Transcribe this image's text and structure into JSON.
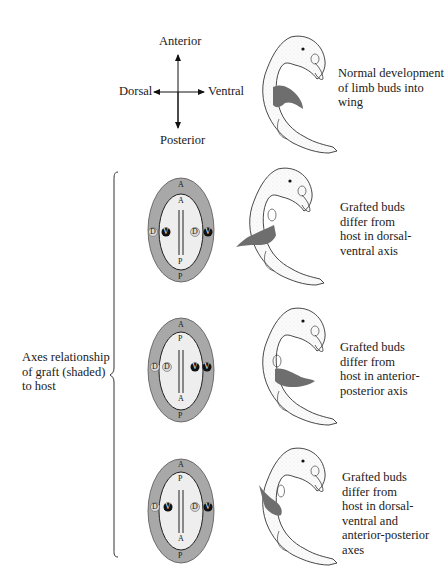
{
  "axes_key": {
    "anterior": "Anterior",
    "posterior": "Posterior",
    "dorsal": "Dorsal",
    "ventral": "Ventral"
  },
  "normal": {
    "caption": "Normal development\nof limb buds into\nwing"
  },
  "group_label": "Axes relationship\nof graft (shaded)\nto host",
  "panels": [
    {
      "caption": "Grafted buds\ndiffer from\nhost in dorsal-\nventral axis",
      "outer_top": "A",
      "outer_bottom": "P",
      "inner_top": "A",
      "inner_bottom": "P",
      "left_outer": "D",
      "left_inner": "V",
      "right_inner": "D",
      "right_outer": "V"
    },
    {
      "caption": "Grafted buds\ndiffer from\nhost in anterior-\nposterior axis",
      "outer_top": "A",
      "outer_bottom": "P",
      "inner_top": "P",
      "inner_bottom": "A",
      "left_outer": "D",
      "left_inner": "D",
      "right_inner": "V",
      "right_outer": "V"
    },
    {
      "caption": "Grafted buds\ndiffer from\nhost in dorsal-\nventral and\nanterior-posterior\naxes",
      "outer_top": "A",
      "outer_bottom": "P",
      "inner_top": "P",
      "inner_bottom": "A",
      "left_outer": "D",
      "left_inner": "V",
      "right_inner": "D",
      "right_outer": "V"
    }
  ],
  "colors": {
    "host_shade": "#a8a8a8",
    "graft_shade": "#6e6e6e",
    "ventral_marker": "#111111",
    "dorsal_marker": "#d8d8d8"
  }
}
